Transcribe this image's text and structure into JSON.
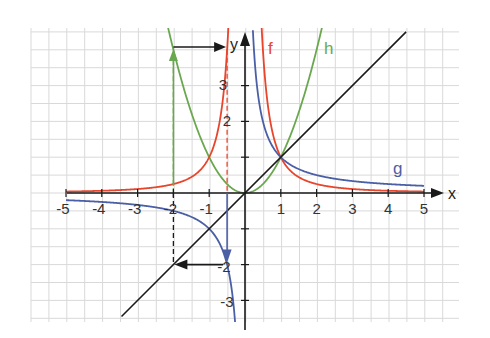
{
  "chart_data": {
    "type": "line",
    "title": "",
    "xlabel": "x",
    "ylabel": "y",
    "xlim": [
      -5.95,
      6.0
    ],
    "ylim": [
      -3.6,
      4.6
    ],
    "grid": true,
    "grid_step": 0.5,
    "x_ticks": [
      -5,
      -4,
      -3,
      -2,
      -1,
      1,
      2,
      3,
      4,
      5
    ],
    "y_ticks": [
      3,
      2,
      1,
      -2,
      -3
    ],
    "y_tick_labels_shown": [
      "3",
      "2",
      "-2",
      "-3"
    ],
    "x_tick_labels": [
      "-5",
      "-4",
      "-3",
      "-2",
      "-1",
      "1",
      "2",
      "3",
      "4",
      "5"
    ],
    "series": [
      {
        "name": "f",
        "formula": "y = 1/x^2",
        "color": "#e8452c",
        "x_range": [
          -5,
          5
        ]
      },
      {
        "name": "g",
        "formula": "y = 1/x",
        "color": "#4a5fa5",
        "x_range": [
          -5,
          5
        ]
      },
      {
        "name": "h",
        "formula": "y = x^2",
        "color": "#6aa84f",
        "x_range": [
          -2.15,
          2.15
        ]
      },
      {
        "name": "identity",
        "formula": "y = x",
        "color": "#1a1a1a",
        "x_range": [
          -3.45,
          4.5
        ]
      }
    ],
    "annotations": [
      {
        "type": "dashed-line",
        "color": "#6aa84f",
        "from": [
          -2,
          -2
        ],
        "to": [
          -2,
          4
        ]
      },
      {
        "type": "dashed-line",
        "color": "#e8452c",
        "from": [
          -0.5,
          4
        ],
        "to": [
          -0.5,
          0
        ]
      },
      {
        "type": "arrow",
        "color": "#6aa84f",
        "from": [
          -2,
          0
        ],
        "to": [
          -2,
          4
        ]
      },
      {
        "type": "arrow",
        "color": "#1a1a1a",
        "from": [
          -2,
          4
        ],
        "to": [
          -0.5,
          4
        ]
      },
      {
        "type": "arrow",
        "color": "#4a5fa5",
        "from": [
          -0.5,
          0
        ],
        "to": [
          -0.5,
          -2
        ]
      },
      {
        "type": "arrow",
        "color": "#1a1a1a",
        "from": [
          -0.5,
          -2
        ],
        "to": [
          -2,
          -2
        ]
      },
      {
        "type": "dashed-line",
        "color": "#1a1a1a",
        "from": [
          -2,
          0
        ],
        "to": [
          -2,
          -2
        ]
      }
    ],
    "function_labels": [
      {
        "text": "f",
        "at": [
          0.55,
          4.1
        ],
        "color": "#e8452c"
      },
      {
        "text": "h",
        "at": [
          2.25,
          4.1
        ],
        "color": "#6aa84f"
      },
      {
        "text": "g",
        "at": [
          4.3,
          0.6
        ],
        "color": "#4a5fa5"
      }
    ]
  },
  "labels": {
    "x_axis": "x",
    "y_axis": "y",
    "f": "f",
    "g": "g",
    "h": "h",
    "xt": [
      "-5",
      "-4",
      "-3",
      "-2",
      "-1",
      "1",
      "2",
      "3",
      "4",
      "5"
    ],
    "yt_3": "3",
    "yt_2": "2",
    "yt_m2": "-2",
    "yt_m3": "-3"
  },
  "colors": {
    "f": "#e8452c",
    "g": "#4a5fa5",
    "h": "#6aa84f",
    "identity": "#1a1a1a",
    "grid": "#d9d9d9",
    "axis": "#1a1a1a"
  }
}
